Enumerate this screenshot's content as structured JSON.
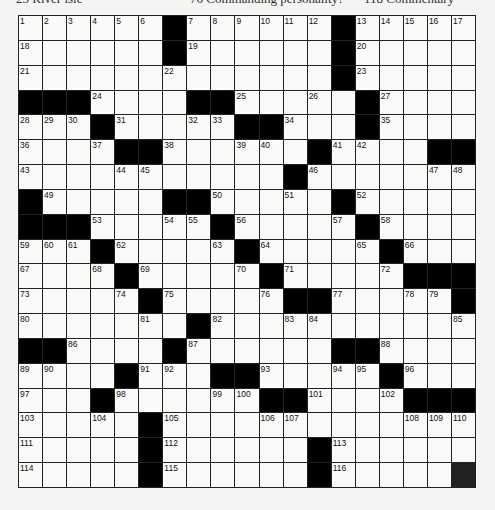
{
  "top_clues": [
    {
      "text": "23 River isle",
      "x": 16
    },
    {
      "text": "76 Commanding personality?",
      "x": 190
    },
    {
      "text": "118 Commentary",
      "x": 364
    }
  ],
  "grid": {
    "rows": 19,
    "cols": 19,
    "cells": [
      [
        "1",
        "2",
        "3",
        "4",
        "5",
        "6",
        "#",
        "7",
        "8",
        "9",
        "10",
        "11",
        "12",
        "#",
        "13",
        "14",
        "15",
        "16",
        "17"
      ],
      [
        "18",
        "",
        "",
        "",
        "",
        "",
        "#",
        "19",
        "",
        "",
        "",
        "",
        "",
        "#",
        "20",
        "",
        "",
        "",
        ""
      ],
      [
        "21",
        "",
        "",
        "",
        "",
        "",
        "22",
        "",
        "",
        "",
        "",
        "",
        "",
        "#",
        "23",
        "",
        "",
        "",
        ""
      ],
      [
        "#",
        "#",
        "#",
        "24",
        "",
        "",
        "",
        "#",
        "#",
        "25",
        "",
        "",
        "26",
        "",
        "#",
        "27",
        "",
        "",
        ""
      ],
      [
        "28",
        "29",
        "30",
        "#",
        "31",
        "",
        "",
        "32",
        "33",
        "#",
        "#",
        "34",
        "",
        "",
        "#",
        "35",
        "",
        "",
        ""
      ],
      [
        "36",
        "",
        "",
        "37",
        "#",
        "#",
        "38",
        "",
        "",
        "39",
        "40",
        "",
        "#",
        "41",
        "42",
        "",
        "",
        "#",
        "#"
      ],
      [
        "43",
        "",
        "",
        "",
        "44",
        "45",
        "",
        "",
        "",
        "",
        "",
        "#",
        "46",
        "",
        "",
        "",
        "",
        "47",
        "48"
      ],
      [
        "#",
        "49",
        "",
        "",
        "",
        "",
        "#",
        "#",
        "50",
        "",
        "",
        "51",
        "",
        "#",
        "52",
        "",
        "",
        "",
        ""
      ],
      [
        "#",
        "#",
        "#",
        "53",
        "",
        "",
        "54",
        "55",
        "#",
        "56",
        "",
        "",
        "",
        "57",
        "#",
        "58",
        "",
        "",
        ""
      ],
      [
        "59",
        "60",
        "61",
        "#",
        "62",
        "",
        "",
        "",
        "63",
        "#",
        "64",
        "",
        "",
        "",
        "65",
        "#",
        "66",
        "",
        ""
      ],
      [
        "67",
        "",
        "",
        "68",
        "#",
        "69",
        "",
        "",
        "",
        "70",
        "#",
        "71",
        "",
        "",
        "",
        "72",
        "#",
        "#",
        "#"
      ],
      [
        "73",
        "",
        "",
        "",
        "74",
        "#",
        "75",
        "",
        "",
        "",
        "76",
        "#",
        "#",
        "77",
        "",
        "",
        "78",
        "79",
        "#"
      ],
      [
        "80",
        "",
        "",
        "",
        "",
        "81",
        "",
        "#",
        "82",
        "",
        "",
        "83",
        "84",
        "",
        "",
        "",
        "",
        "",
        "85"
      ],
      [
        "#",
        "#",
        "86",
        "",
        "",
        "",
        "#",
        "87",
        "",
        "",
        "",
        "",
        "",
        "#",
        "#",
        "88",
        "",
        "",
        ""
      ],
      [
        "89",
        "90",
        "",
        "",
        "#",
        "91",
        "92",
        "",
        "#",
        "#",
        "93",
        "",
        "",
        "94",
        "95",
        "#",
        "96",
        "",
        ""
      ],
      [
        "97",
        "",
        "",
        "#",
        "98",
        "",
        "",
        "",
        "99",
        "100",
        "#",
        "#",
        "101",
        "",
        "",
        "102",
        "#",
        "#",
        "#"
      ],
      [
        "103",
        "",
        "",
        "104",
        "",
        "#",
        "105",
        "",
        "",
        "",
        "106",
        "107",
        "",
        "",
        "",
        "",
        "108",
        "109",
        "110"
      ],
      [
        "111",
        "",
        "",
        "",
        "",
        "#",
        "112",
        "",
        "",
        "",
        "",
        "",
        "#",
        "113",
        "",
        "",
        "",
        "",
        ""
      ],
      [
        "114",
        "",
        "",
        "",
        "",
        "#",
        "115",
        "",
        "",
        "",
        "",
        "",
        "#",
        "116",
        "",
        "",
        "",
        ""
      ]
    ]
  },
  "colors": {
    "black_cell": "#000000",
    "white_cell": "#fafaf8",
    "grid_line": "#222222",
    "background": "#f4f4f2"
  }
}
